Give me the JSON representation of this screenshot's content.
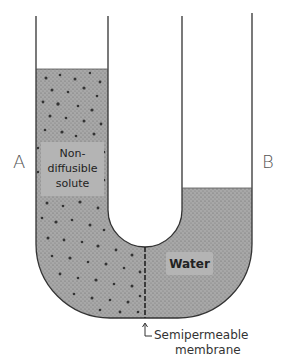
{
  "diagram": {
    "labels": {
      "side_a": "A",
      "side_b": "B",
      "solute_line1": "Non-",
      "solute_line2": "diffusible",
      "solute_line3": "solute",
      "water": "Water",
      "membrane_line1": "Semipermeable",
      "membrane_line2": "membrane"
    },
    "colors": {
      "tube_wall": "#333333",
      "fluid_fill": "#9a9a9a",
      "label_box": "#b4b4b4",
      "solute_particle": "#333333",
      "background": "#ffffff"
    },
    "levels": {
      "left_fluid_top_y": 69,
      "right_fluid_top_y": 188
    }
  }
}
